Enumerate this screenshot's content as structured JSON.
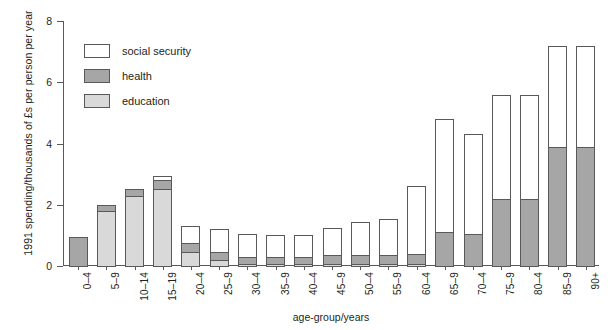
{
  "chart_data": {
    "type": "bar",
    "subtype": "stacked-bar",
    "title": "",
    "xlabel": "age-group/years",
    "ylabel": "1991 spending/thousands of £s per person per year",
    "ylim": [
      0,
      8
    ],
    "yticks": [
      0,
      2,
      4,
      6,
      8
    ],
    "ytick_labels": [
      "0",
      "2",
      "4",
      "6",
      "8"
    ],
    "grid": false,
    "legend_position": "upper-left-inside",
    "categories": [
      "0–4",
      "5–9",
      "10–14",
      "15–19",
      "20–4",
      "25–9",
      "30–4",
      "35–9",
      "40–4",
      "45–9",
      "50–4",
      "55–9",
      "60–4",
      "65–9",
      "70–4",
      "75–9",
      "80–4",
      "85–9",
      "90+"
    ],
    "series": [
      {
        "name": "education",
        "color": "#d9d9d9",
        "values": [
          0.0,
          1.8,
          2.3,
          2.5,
          0.45,
          0.2,
          0.05,
          0.05,
          0.05,
          0.05,
          0.05,
          0.05,
          0.05,
          0.0,
          0.0,
          0.0,
          0.0,
          0.0,
          0.0
        ]
      },
      {
        "name": "health",
        "color": "#a6a6a6",
        "values": [
          0.95,
          0.2,
          0.2,
          0.3,
          0.3,
          0.25,
          0.25,
          0.25,
          0.25,
          0.3,
          0.3,
          0.3,
          0.35,
          1.1,
          1.05,
          2.2,
          2.2,
          3.9,
          3.9
        ]
      },
      {
        "name": "social security",
        "color": "#ffffff",
        "values": [
          0.0,
          0.0,
          0.0,
          0.15,
          0.55,
          0.75,
          0.75,
          0.7,
          0.7,
          0.9,
          1.1,
          1.2,
          2.2,
          3.7,
          3.25,
          3.4,
          3.4,
          3.3,
          3.3
        ]
      }
    ],
    "totals": [
      0.95,
      2.0,
      2.5,
      2.95,
      1.3,
      1.2,
      1.05,
      1.0,
      1.0,
      1.25,
      1.45,
      1.55,
      2.6,
      4.8,
      4.3,
      5.6,
      5.6,
      7.2,
      7.2
    ]
  },
  "legend": {
    "entries": [
      {
        "label": "social security",
        "key": "social"
      },
      {
        "label": "health",
        "key": "health"
      },
      {
        "label": "education",
        "key": "education"
      }
    ]
  },
  "colors": {
    "education": "#d9d9d9",
    "health": "#a6a6a6",
    "social_security": "#ffffff",
    "axis": "#58595b",
    "text": "#231f20",
    "background": "#ffffff"
  }
}
